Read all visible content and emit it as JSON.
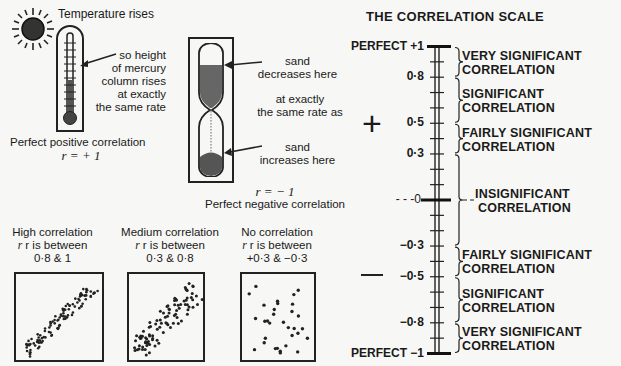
{
  "left": {
    "positive_example": {
      "heading": "Temperature rises",
      "annotation_lines": [
        "so height",
        "of mercury",
        "column rises",
        "at exactly",
        "the same rate"
      ],
      "caption": "Perfect positive correlation",
      "r_label": "r = + 1",
      "icons": [
        "sun-icon",
        "thermometer-icon"
      ]
    },
    "negative_example": {
      "top_annotation": [
        "sand",
        "decreases here"
      ],
      "middle_annotation": [
        "at exactly",
        "the same rate as"
      ],
      "bottom_annotation": [
        "sand",
        "increases here"
      ],
      "r_label": "r = − 1",
      "caption": "Perfect negative correlation",
      "icons": [
        "hourglass-icon"
      ]
    },
    "scatter_examples": [
      {
        "title": "High correlation",
        "line2": "r is between",
        "range": "0·8 & 1"
      },
      {
        "title": "Medium correlation",
        "line2": "r is between",
        "range": "0·3 & 0·8"
      },
      {
        "title": "No correlation",
        "line2": "r is between",
        "range": "+0·3 & −0·3"
      }
    ]
  },
  "scale": {
    "title": "THE CORRELATION SCALE",
    "plus_sign": "+",
    "minus_sign": "—",
    "ticks": [
      {
        "value": 1,
        "label": "PERFECT +1"
      },
      {
        "value": 0.8,
        "label": "0·8"
      },
      {
        "value": 0.5,
        "label": "0·5"
      },
      {
        "value": 0.3,
        "label": "0·3"
      },
      {
        "value": 0,
        "label": "- - -0-"
      },
      {
        "value": -0.3,
        "label": "−0·3"
      },
      {
        "value": -0.5,
        "label": "−0·5"
      },
      {
        "value": -0.8,
        "label": "−0·8"
      },
      {
        "value": -1,
        "label": "PERFECT −1"
      }
    ],
    "categories": [
      {
        "from": 1,
        "to": 0.8,
        "line1": "VERY SIGNIFICANT",
        "line2": "CORRELATION"
      },
      {
        "from": 0.8,
        "to": 0.5,
        "line1": "SIGNIFICANT",
        "line2": "CORRELATION"
      },
      {
        "from": 0.5,
        "to": 0.3,
        "line1": "FAIRLY SIGNIFICANT",
        "line2": "CORRELATION"
      },
      {
        "from": 0.3,
        "to": -0.3,
        "line1": "INSIGNIFICANT",
        "line2": "CORRELATION"
      },
      {
        "from": -0.3,
        "to": -0.5,
        "line1": "FAIRLY SIGNIFICANT",
        "line2": "CORRELATION"
      },
      {
        "from": -0.5,
        "to": -0.8,
        "line1": "SIGNIFICANT",
        "line2": "CORRELATION"
      },
      {
        "from": -0.8,
        "to": -1,
        "line1": "VERY SIGNIFICANT",
        "line2": "CORRELATION"
      }
    ]
  }
}
